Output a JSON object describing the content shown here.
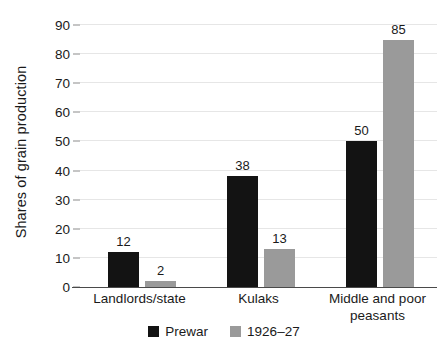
{
  "chart_data": {
    "type": "bar",
    "title": "",
    "subtitle": "",
    "xlabel": "",
    "ylabel": "Shares of grain production",
    "ylim": [
      0,
      90
    ],
    "ytick_step": 10,
    "yticks": [
      90,
      80,
      70,
      60,
      50,
      40,
      30,
      20,
      10,
      0
    ],
    "categories": [
      "Landlords/state",
      "Kulaks",
      "Middle and poor peasants"
    ],
    "series": [
      {
        "name": "Prewar",
        "color": "#131313",
        "values": [
          12,
          38,
          50
        ]
      },
      {
        "name": "1926–27",
        "color": "#9a9a9a",
        "values": [
          2,
          13,
          85
        ]
      }
    ],
    "grid": true,
    "grid_axis": "y",
    "grid_color": "#e6e6e6",
    "legend_position": "bottom-center",
    "value_labels": true,
    "background_color": "#ffffff",
    "axis_color": "#4a4a4a"
  }
}
